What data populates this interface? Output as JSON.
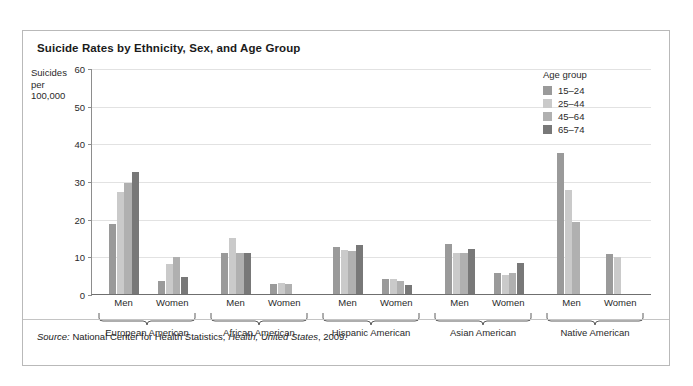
{
  "figure": {
    "title": "Suicide Rates by Ethnicity, Sex, and Age Group",
    "source_prefix": "Source:",
    "source_body": "National Center for Health Statistics,",
    "source_italic": "Health, United States",
    "source_year": ", 2009."
  },
  "legend": {
    "title": "Age group",
    "entries": [
      {
        "label": "15–24",
        "color": "#9a9a9a"
      },
      {
        "label": "25–44",
        "color": "#cacaca"
      },
      {
        "label": "45–64",
        "color": "#b0b0b0"
      },
      {
        "label": "65–74",
        "color": "#787878"
      }
    ]
  },
  "chart_data": {
    "type": "bar",
    "title": "Suicide Rates by Ethnicity, Sex, and Age Group",
    "xlabel": "",
    "ylabel": "Suicides per 100,000",
    "ylim": [
      0,
      60
    ],
    "yticks": [
      0,
      10,
      20,
      30,
      40,
      50,
      60
    ],
    "grid": true,
    "legend_position": "top-right",
    "legend_title": "Age group",
    "series": [
      {
        "name": "15–24",
        "color": "#9a9a9a",
        "values": [
          18.5,
          3.5,
          11.0,
          2.7,
          12.5,
          4.0,
          13.2,
          5.5,
          37.5,
          10.5
        ]
      },
      {
        "name": "25–44",
        "color": "#cacaca",
        "values": [
          27.0,
          8.0,
          14.8,
          2.8,
          11.8,
          4.0,
          10.8,
          5.0,
          27.5,
          9.8
        ]
      },
      {
        "name": "45–64",
        "color": "#b0b0b0",
        "values": [
          29.5,
          9.7,
          11.0,
          2.6,
          11.5,
          3.5,
          11.0,
          5.5,
          19.0,
          null
        ]
      },
      {
        "name": "65–74",
        "color": "#787878",
        "values": [
          32.5,
          4.5,
          11.0,
          null,
          13.0,
          2.5,
          12.0,
          8.3,
          null,
          null
        ]
      }
    ],
    "categories": [
      "European American Men",
      "European American Women",
      "African American Men",
      "African American Women",
      "Hispanic American Men",
      "Hispanic American Women",
      "Asian American Men",
      "Asian American Women",
      "Native American Men",
      "Native American Women"
    ],
    "sex_labels": [
      "Men",
      "Women",
      "Men",
      "Women",
      "Men",
      "Women",
      "Men",
      "Women",
      "Men",
      "Women"
    ],
    "ethnicity_groups": [
      "European American",
      "African American",
      "Hispanic American",
      "Asian American",
      "Native American"
    ]
  }
}
